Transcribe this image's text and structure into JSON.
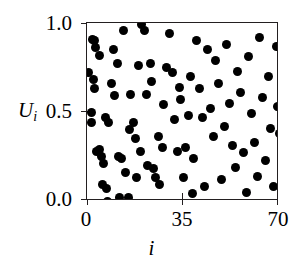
{
  "chart_data": {
    "type": "scatter",
    "title": "",
    "xlabel": "i",
    "ylabel": "U_i",
    "ylabel_display": "U",
    "ylabel_subscript": "i",
    "xlim": [
      0,
      70
    ],
    "ylim": [
      0,
      1.0
    ],
    "grid": false,
    "legend": null,
    "xticks": [
      0,
      35,
      70
    ],
    "xtick_labels": [
      "0",
      "35",
      "70"
    ],
    "yticks": [
      0.0,
      0.5,
      1.0
    ],
    "ytick_labels": [
      "0.0",
      "0.5",
      "1.0"
    ],
    "marker": "filled-circle",
    "marker_color": "#000000",
    "marker_size_px": 9,
    "frame_color": "#231f20",
    "background": "#ffffff",
    "n_points": 92,
    "x": [
      0.4,
      1.6,
      1.8,
      2.0,
      2.4,
      2.6,
      2.8,
      3.0,
      3.4,
      4.4,
      4.6,
      5.2,
      5.6,
      6.0,
      6.6,
      7.0,
      7.4,
      8.0,
      9.0,
      9.6,
      10.2,
      11.0,
      11.6,
      12.0,
      12.6,
      13.2,
      14.0,
      15.0,
      15.6,
      16.0,
      17.0,
      17.6,
      18.2,
      18.6,
      19.4,
      20.0,
      21.0,
      21.6,
      22.0,
      23.0,
      23.6,
      24.4,
      25.0,
      26.0,
      26.6,
      27.4,
      28.0,
      29.0,
      30.0,
      31.0,
      32.0,
      33.0,
      34.0,
      35.0,
      36.0,
      37.0,
      37.6,
      38.4,
      39.0,
      40.0,
      41.0,
      42.0,
      43.0,
      44.0,
      45.0,
      46.0,
      47.0,
      48.0,
      49.0,
      50.0,
      51.0,
      52.0,
      53.0,
      54.0,
      55.0,
      56.0,
      57.0,
      58.0,
      59.0,
      60.0,
      61.0,
      62.0,
      63.0,
      64.0,
      65.0,
      66.0,
      67.0,
      68.0,
      69.0,
      69.6,
      70.0,
      33.6,
      48.6
    ],
    "y": [
      0.72,
      0.5,
      0.44,
      0.91,
      0.68,
      0.63,
      0.9,
      0.86,
      0.28,
      0.82,
      0.29,
      0.25,
      0.09,
      0.21,
      0.47,
      0.07,
      0.0,
      0.44,
      0.66,
      0.85,
      0.59,
      0.77,
      0.25,
      0.02,
      0.24,
      0.96,
      0.16,
      0.02,
      0.4,
      0.6,
      0.44,
      0.35,
      0.13,
      0.76,
      0.28,
      0.99,
      0.96,
      0.6,
      0.2,
      0.77,
      0.67,
      0.18,
      0.13,
      0.36,
      0.09,
      0.3,
      0.54,
      0.75,
      0.94,
      0.72,
      0.46,
      0.28,
      0.57,
      0.13,
      0.3,
      0.48,
      0.7,
      0.04,
      0.24,
      0.9,
      0.63,
      0.47,
      0.08,
      0.85,
      0.52,
      0.36,
      0.79,
      0.66,
      0.12,
      0.42,
      0.88,
      0.55,
      0.31,
      0.19,
      0.73,
      0.61,
      0.27,
      0.05,
      0.81,
      0.49,
      0.33,
      0.14,
      0.92,
      0.58,
      0.23,
      0.7,
      0.41,
      0.08,
      0.87,
      0.53,
      0.38,
      0.64
    ]
  },
  "axes": {
    "x_title": "i",
    "y_title": "U",
    "y_title_sub": "i",
    "x_tick_labels": [
      "0",
      "35",
      "70"
    ],
    "y_tick_labels": [
      "0.0",
      "0.5",
      "1.0"
    ]
  }
}
